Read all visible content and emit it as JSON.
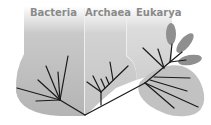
{
  "diagram": {
    "domains": [
      {
        "label": "Bacteria",
        "fill": "#b4b4b4"
      },
      {
        "label": "Archaea",
        "fill": "#c4c4c4"
      },
      {
        "label": "Eukarya",
        "fill": "#c8c8c8"
      }
    ],
    "colors": {
      "branch": "#1a1a1a",
      "divider": "#eeeeee",
      "label": "#8a8a8a",
      "petal": "#8f8f8f",
      "background": "#ffffff"
    }
  }
}
